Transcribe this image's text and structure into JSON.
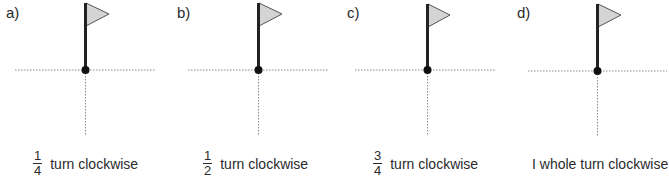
{
  "worksheet": {
    "colors": {
      "pole": "#222222",
      "flag_fill": "#d4d4d4",
      "flag_outline": "#555555",
      "axis_line": "#8a8a8a",
      "center_dot": "#111111",
      "text": "#2a2a2a"
    },
    "panels": [
      {
        "label": "a)",
        "fraction": {
          "numerator": "1",
          "denominator": "4"
        },
        "caption": "turn clockwise",
        "pivot": {
          "x": 85,
          "y": 70
        }
      },
      {
        "label": "b)",
        "fraction": {
          "numerator": "1",
          "denominator": "2"
        },
        "caption": "turn clockwise",
        "pivot": {
          "x": 258,
          "y": 70
        }
      },
      {
        "label": "c)",
        "fraction": {
          "numerator": "3",
          "denominator": "4"
        },
        "caption": "turn clockwise",
        "pivot": {
          "x": 427,
          "y": 70
        }
      },
      {
        "label": "d)",
        "fraction": null,
        "caption": "I whole turn clockwise",
        "pivot": {
          "x": 597,
          "y": 70
        }
      }
    ]
  }
}
